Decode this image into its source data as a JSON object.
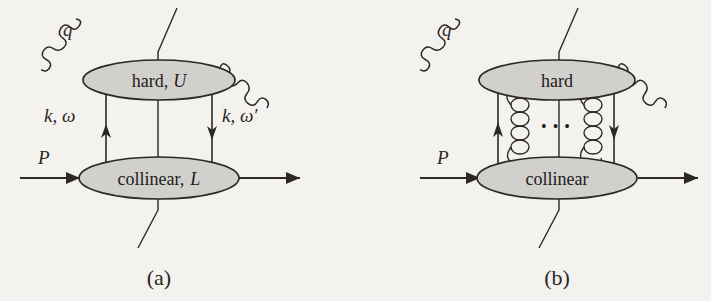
{
  "figure": {
    "type": "feynman-diagram",
    "background_color": "#f4f2ee",
    "ink_color": "#2b2826",
    "blob_fill_color": "#d2d0cd",
    "panels": [
      {
        "id": "a",
        "caption": "(a)",
        "hard_blob_label": "hard, U",
        "hard_blob_label_main": "hard,",
        "hard_blob_label_sub": "U",
        "collinear_blob_label": "collinear, L",
        "collinear_blob_label_main": "collinear,",
        "collinear_blob_label_sub": "L",
        "photon_label": "q",
        "hadron_label": "P",
        "left_rung_label": "k, ω",
        "right_rung_label": "k, ω′",
        "has_cut_line": true,
        "has_gluon_ladder": false
      },
      {
        "id": "b",
        "caption": "(b)",
        "hard_blob_label": "hard",
        "hard_blob_label_main": "hard",
        "hard_blob_label_sub": "",
        "collinear_blob_label": "collinear",
        "collinear_blob_label_main": "collinear",
        "collinear_blob_label_sub": "",
        "photon_label": "q",
        "hadron_label": "P",
        "left_rung_label": "",
        "right_rung_label": "",
        "ellipsis": "• • •",
        "has_cut_line": true,
        "has_gluon_ladder": true,
        "gluon_count": 2
      }
    ]
  }
}
